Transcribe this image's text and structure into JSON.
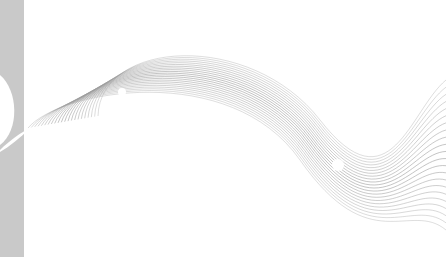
{
  "image": {
    "description": "Abstract wave lines graphic",
    "colors": {
      "background": "#ffffff",
      "side_bar": "#c9c9c9",
      "lines": "#9a9a9a"
    },
    "line_count": 22
  }
}
